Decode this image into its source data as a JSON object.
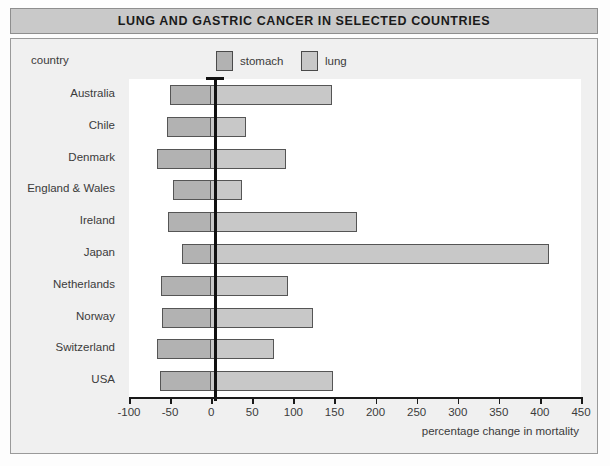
{
  "title": "LUNG AND GASTRIC CANCER IN SELECTED COUNTRIES",
  "legend": {
    "country_label": "country",
    "items": [
      {
        "label": "stomach",
        "color": "#b2b2b2"
      },
      {
        "label": "lung",
        "color": "#c8c8c8"
      }
    ]
  },
  "chart_data": {
    "type": "bar",
    "orientation": "horizontal",
    "title": "LUNG AND GASTRIC CANCER IN SELECTED COUNTRIES",
    "xlabel": "percentage change in mortality",
    "ylabel": "country",
    "xlim": [
      -100,
      450
    ],
    "xticks": [
      -100,
      -50,
      0,
      50,
      100,
      150,
      200,
      250,
      300,
      350,
      400,
      450
    ],
    "xticklabels": [
      "-100",
      "-50",
      "0",
      "50",
      "100",
      "150",
      "200",
      "250",
      "300",
      "350",
      "400",
      "450"
    ],
    "grid": false,
    "legend_position": "top",
    "categories": [
      "Australia",
      "Chile",
      "Denmark",
      "England & Wales",
      "Ireland",
      "Japan",
      "Netherlands",
      "Norway",
      "Switzerland",
      "USA"
    ],
    "series": [
      {
        "name": "stomach",
        "color": "#b2b2b2",
        "values": [
          -50,
          -54,
          -66,
          -47,
          -52,
          -35,
          -61,
          -60,
          -66,
          -62
        ]
      },
      {
        "name": "lung",
        "color": "#c8c8c8",
        "values": [
          147,
          42,
          91,
          38,
          178,
          411,
          94,
          124,
          76,
          148
        ]
      }
    ]
  }
}
